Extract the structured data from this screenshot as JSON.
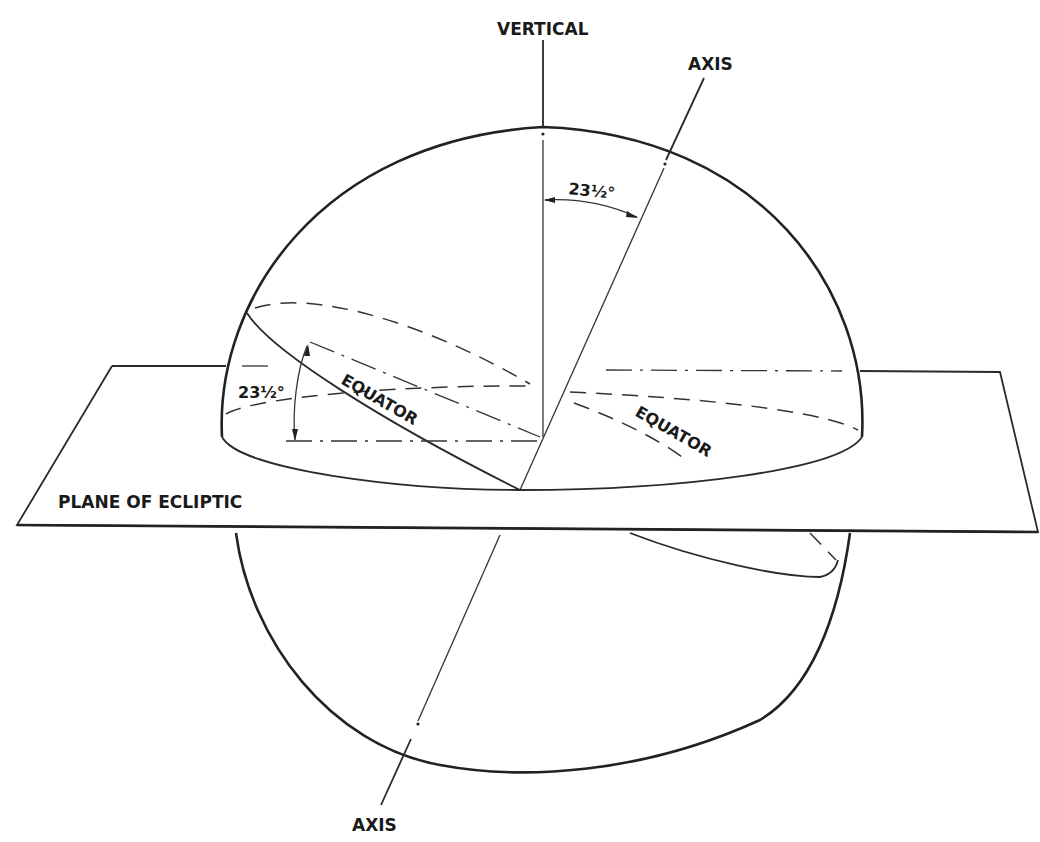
{
  "diagram": {
    "labels": {
      "vertical": "VERTICAL",
      "axis_top": "AXIS",
      "axis_bottom": "AXIS",
      "tilt_angle_top": "23½°",
      "tilt_angle_left": "23½°",
      "equator_left": "EQUATOR",
      "equator_right": "EQUATOR",
      "plane": "PLANE OF ECLIPTIC"
    },
    "angles": {
      "axial_tilt_degrees": 23.5
    },
    "colors": {
      "line": "#222222",
      "background": "#ffffff"
    }
  }
}
